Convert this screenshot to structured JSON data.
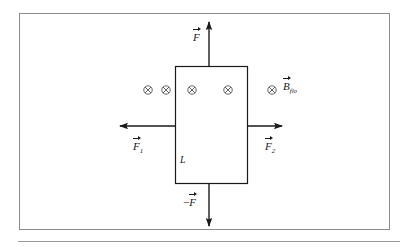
{
  "figure": {
    "type": "physics-free-body-diagram",
    "frame": {
      "border_color": "#8c8c8c",
      "background": "#ffffff"
    },
    "rule_color": "#9a9a9a",
    "stroke_color": "#1a1a1a"
  },
  "loop": {
    "name": "current-loop-rectangle",
    "side_label": "L",
    "x": 175,
    "y": 66,
    "width": 73,
    "height": 118
  },
  "field": {
    "symbol": "field-into-page",
    "glyph": "⊗",
    "label_base": "B",
    "label_subscript": "flo",
    "count": 5,
    "positions_x": [
      148,
      166,
      192,
      228,
      272
    ],
    "y": 90
  },
  "vectors": [
    {
      "name": "force-up",
      "label_base": "F",
      "label_prefix": "",
      "label_subscript": "",
      "direction": "up",
      "from": {
        "x": 209,
        "y": 66
      },
      "to": {
        "x": 209,
        "y": 20
      }
    },
    {
      "name": "force-left",
      "label_base": "F",
      "label_prefix": "",
      "label_subscript": "1",
      "direction": "left",
      "from": {
        "x": 175,
        "y": 126
      },
      "to": {
        "x": 118,
        "y": 126
      }
    },
    {
      "name": "force-right",
      "label_base": "F",
      "label_prefix": "",
      "label_subscript": "2",
      "direction": "right",
      "from": {
        "x": 248,
        "y": 126
      },
      "to": {
        "x": 284,
        "y": 126
      }
    },
    {
      "name": "force-down",
      "label_base": "F",
      "label_prefix": "−",
      "label_subscript": "",
      "direction": "down",
      "from": {
        "x": 209,
        "y": 184
      },
      "to": {
        "x": 209,
        "y": 228
      }
    }
  ],
  "labels": {
    "force_up": "F",
    "force_left_base": "F",
    "force_left_sub": "1",
    "force_right_base": "F",
    "force_right_sub": "2",
    "force_down_prefix": "−",
    "force_down_base": "F",
    "length": "L",
    "field_base": "B",
    "field_sub": "flo",
    "cross_glyph": "⊗"
  }
}
